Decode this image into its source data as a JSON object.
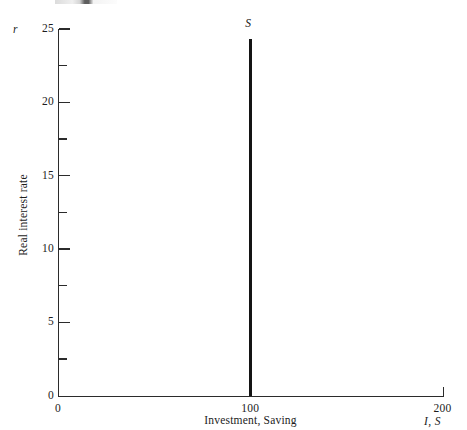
{
  "figure": {
    "background_color": "#ffffff",
    "ink_color": "#1c1c1c",
    "series_color": "#141414"
  },
  "axes": {
    "y": {
      "variable": "r",
      "title": "Real interest rate",
      "ticks": [
        {
          "value": 0,
          "label": "0",
          "major": true
        },
        {
          "value": 2.5,
          "label": "",
          "major": false
        },
        {
          "value": 5,
          "label": "5",
          "major": true
        },
        {
          "value": 7.5,
          "label": "",
          "major": false
        },
        {
          "value": 10,
          "label": "10",
          "major": true
        },
        {
          "value": 12.5,
          "label": "",
          "major": false
        },
        {
          "value": 15,
          "label": "15",
          "major": true
        },
        {
          "value": 17.5,
          "label": "",
          "major": false
        },
        {
          "value": 20,
          "label": "20",
          "major": true
        },
        {
          "value": 22.5,
          "label": "",
          "major": false
        },
        {
          "value": 25,
          "label": "25",
          "major": true
        }
      ]
    },
    "x": {
      "variable": "I, S",
      "title": "Investment, Saving",
      "ticks": [
        {
          "value": 0,
          "label": "0"
        },
        {
          "value": 100,
          "label": "100"
        },
        {
          "value": 200,
          "label": "200"
        }
      ]
    }
  },
  "chart_data": {
    "type": "line",
    "title": "",
    "subtitle": "",
    "xlabel": "Investment, Saving",
    "ylabel": "Real interest rate",
    "xlim": [
      0,
      200
    ],
    "ylim": [
      0,
      25
    ],
    "grid": false,
    "legend": "none",
    "xticks": [
      0,
      100,
      200
    ],
    "xticklabels": [
      "0",
      "100",
      "200"
    ],
    "yticks": [
      0,
      5,
      10,
      15,
      20,
      25
    ],
    "yticklabels": [
      "0",
      "5",
      "10",
      "15",
      "20",
      "25"
    ],
    "yminorticks": [
      2.5,
      7.5,
      12.5,
      17.5,
      22.5
    ],
    "series": [
      {
        "name": "S",
        "label": "S",
        "description": "Vertical saving schedule: saving fixed at 100 regardless of the real interest rate",
        "x": [
          100,
          100
        ],
        "y": [
          0,
          24.3
        ],
        "color": "#141414",
        "linewidth": 2.6,
        "annotation": {
          "text": "S",
          "x": 100,
          "y": 25.4,
          "italic": true
        }
      }
    ],
    "annotations": [
      {
        "text": "S",
        "x": 100,
        "y": 25.4,
        "role": "series-label"
      }
    ]
  }
}
